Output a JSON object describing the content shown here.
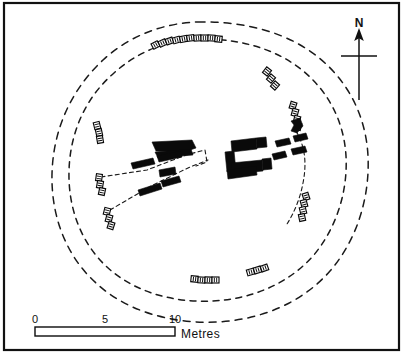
{
  "figure": {
    "kind": "archaeological-site-plan",
    "background_color": "#ffffff",
    "ink_color": "#0a0a0a",
    "frame": {
      "stroke": "#111111",
      "x": 4,
      "y": 3,
      "width": 395,
      "height": 347
    }
  },
  "north_arrow": {
    "label": "N",
    "label_x": 359,
    "label_y": 27,
    "stem_x": 359,
    "stem_top": 32,
    "stem_bottom": 100,
    "cross_y": 56,
    "cross_left": 341,
    "cross_right": 377,
    "head_points": "359,28 354.2,41 359,38.2 363.8,41"
  },
  "scale_bar": {
    "unit_label": "Metres",
    "unit_label_x": 181,
    "unit_label_y": 338,
    "tick_labels": [
      "0",
      "5",
      "10"
    ],
    "tick_values": [
      0,
      5,
      10
    ],
    "tick_x": [
      35,
      105,
      175
    ],
    "tick_label_y": 323,
    "bar_x": 35,
    "bar_y": 327,
    "bar_width": 140,
    "bar_height": 9,
    "segments_metres": 1,
    "filled_segments": [
      {
        "x": 35,
        "width": 14
      },
      {
        "x": 63,
        "width": 14
      },
      {
        "x": 91,
        "width": 14
      }
    ]
  },
  "cairn_rings": [
    {
      "name": "outer-cairn-edge",
      "path": "M 198 22 C 246 21 288 33 318 57 C 348 81 366 116 368 156 C 370 197 357 240 330 271 C 303 302 262 320 216 322 C 169 324 125 310 96 283 C 66 256 51 216 52 174 C 53 131 70 91 103 60 C 129 36 163 23 198 22 Z"
    },
    {
      "name": "inner-cairn-edge",
      "path": "M 197 39 C 239 38 276 49 302 70 C 328 91 344 121 346 156 C 348 192 336 229 313 256 C 289 283 253 299 213 301 C 171 303 133 291 107 267 C 81 243 68 208 69 171 C 70 133 85 98 114 73 C 137 52 167 40 197 39 Z"
    }
  ],
  "passage_outlines": [
    {
      "name": "passage-south-west",
      "path": "M 101 177 L 147 170 L 186 155 L 205 150"
    },
    {
      "name": "passage-west-lower",
      "path": "M 110 210 L 151 186 L 190 167 L 208 160"
    },
    {
      "name": "passage-chamber-west-link",
      "path": "M 205 150 L 207 162 L 196 166"
    },
    {
      "name": "passage-north-east-curve",
      "path": "M 296 131 C 305 146 307 163 303 183 C 300 199 294 213 287 224"
    }
  ],
  "orthostats": [
    {
      "name": "stone-w-large-top",
      "points": "152,142 192,140 196,148 184,152 156,151"
    },
    {
      "name": "stone-w-upper-bar",
      "points": "155,152 191,149 193,155 158,158"
    },
    {
      "name": "stone-w-mid-a",
      "points": "131,163 153,158 155,164 133,169"
    },
    {
      "name": "stone-w-mid-b",
      "points": "157,156 180,151 182,157 159,162"
    },
    {
      "name": "stone-w-small-centre",
      "points": "159,170 175,167 176,174 160,177"
    },
    {
      "name": "stone-w-lower-a",
      "points": "138,190 160,183 162,189 140,196"
    },
    {
      "name": "stone-w-lower-b",
      "points": "161,181 179,176 181,182 163,187"
    },
    {
      "name": "stone-c-top-bar",
      "points": "231,141 256,138 257,149 232,152"
    },
    {
      "name": "stone-c-top-bar-right",
      "points": "256,138 266,137 267,147 257,148"
    },
    {
      "name": "stone-c-left-upright",
      "points": "225,152 234,151 236,171 227,172"
    },
    {
      "name": "stone-c-bottom-bar",
      "points": "231,163 262,160 263,171 232,174"
    },
    {
      "name": "stone-c-bottom-right",
      "points": "262,159 271,158 272,169 263,170"
    },
    {
      "name": "stone-c-bottom-tail",
      "points": "227,170 256,166 257,175 228,179"
    },
    {
      "name": "stone-e-upper-a",
      "points": "275,141 289,138 291,144 277,147"
    },
    {
      "name": "stone-e-upper-b",
      "points": "293,136 306,133 308,139 295,142"
    },
    {
      "name": "stone-e-mid-a",
      "points": "272,154 285,151 287,157 274,160"
    },
    {
      "name": "stone-e-mid-b",
      "points": "291,149 305,146 307,152 293,155"
    },
    {
      "name": "stone-ne-hook",
      "points": "291,121 300,118 303,126 297,133 291,131 294,125"
    }
  ],
  "kerbstone_groups": [
    {
      "name": "kerb-north-arc",
      "rotation": -8,
      "stones": [
        {
          "x": 152,
          "y": 42,
          "w": 7,
          "h": 6,
          "rot": -28
        },
        {
          "x": 159,
          "y": 40,
          "w": 7,
          "h": 6,
          "rot": -24
        },
        {
          "x": 166,
          "y": 38,
          "w": 7,
          "h": 6,
          "rot": -20
        },
        {
          "x": 173,
          "y": 37,
          "w": 7,
          "h": 6,
          "rot": -16
        },
        {
          "x": 180,
          "y": 36,
          "w": 7,
          "h": 6,
          "rot": -12
        },
        {
          "x": 187,
          "y": 35,
          "w": 7,
          "h": 6,
          "rot": -8
        },
        {
          "x": 194,
          "y": 35,
          "w": 7,
          "h": 6,
          "rot": -4
        },
        {
          "x": 201,
          "y": 35,
          "w": 7,
          "h": 6,
          "rot": 0
        },
        {
          "x": 208,
          "y": 35,
          "w": 7,
          "h": 6,
          "rot": 3
        },
        {
          "x": 215,
          "y": 36,
          "w": 7,
          "h": 6,
          "rot": 6
        }
      ]
    },
    {
      "name": "kerb-north-east",
      "stones": [
        {
          "x": 264,
          "y": 68,
          "w": 6,
          "h": 7,
          "rot": 38
        },
        {
          "x": 268,
          "y": 75,
          "w": 6,
          "h": 7,
          "rot": 40
        },
        {
          "x": 272,
          "y": 82,
          "w": 6,
          "h": 7,
          "rot": 42
        }
      ]
    },
    {
      "name": "kerb-east-upper",
      "stones": [
        {
          "x": 290,
          "y": 102,
          "w": 6,
          "h": 7,
          "rot": 18
        },
        {
          "x": 292,
          "y": 109,
          "w": 6,
          "h": 7,
          "rot": 16
        },
        {
          "x": 294,
          "y": 116,
          "w": 6,
          "h": 7,
          "rot": 14
        },
        {
          "x": 295,
          "y": 123,
          "w": 6,
          "h": 7,
          "rot": 12
        }
      ]
    },
    {
      "name": "kerb-east-lower",
      "stones": [
        {
          "x": 303,
          "y": 193,
          "w": 6,
          "h": 7,
          "rot": -18
        },
        {
          "x": 301,
          "y": 200,
          "w": 6,
          "h": 7,
          "rot": -16
        },
        {
          "x": 300,
          "y": 207,
          "w": 6,
          "h": 7,
          "rot": -14
        },
        {
          "x": 299,
          "y": 214,
          "w": 6,
          "h": 7,
          "rot": -12
        }
      ]
    },
    {
      "name": "kerb-west-upper",
      "stones": [
        {
          "x": 94,
          "y": 122,
          "w": 6,
          "h": 7,
          "rot": -14
        },
        {
          "x": 96,
          "y": 129,
          "w": 6,
          "h": 7,
          "rot": -12
        },
        {
          "x": 97,
          "y": 136,
          "w": 6,
          "h": 7,
          "rot": -10
        }
      ]
    },
    {
      "name": "kerb-west-lower",
      "stones": [
        {
          "x": 96,
          "y": 174,
          "w": 6,
          "h": 7,
          "rot": 8
        },
        {
          "x": 97,
          "y": 181,
          "w": 6,
          "h": 7,
          "rot": 10
        },
        {
          "x": 99,
          "y": 188,
          "w": 6,
          "h": 7,
          "rot": 12
        }
      ]
    },
    {
      "name": "kerb-south-west",
      "stones": [
        {
          "x": 104,
          "y": 208,
          "w": 6,
          "h": 7,
          "rot": 14
        },
        {
          "x": 106,
          "y": 215,
          "w": 6,
          "h": 7,
          "rot": 16
        },
        {
          "x": 108,
          "y": 222,
          "w": 6,
          "h": 7,
          "rot": 18
        }
      ]
    },
    {
      "name": "kerb-south-centre",
      "stones": [
        {
          "x": 191,
          "y": 276,
          "w": 7,
          "h": 6,
          "rot": 6
        },
        {
          "x": 198,
          "y": 277,
          "w": 7,
          "h": 6,
          "rot": 4
        },
        {
          "x": 205,
          "y": 277,
          "w": 7,
          "h": 6,
          "rot": 2
        },
        {
          "x": 212,
          "y": 277,
          "w": 7,
          "h": 6,
          "rot": 0
        }
      ]
    },
    {
      "name": "kerb-south-east",
      "stones": [
        {
          "x": 247,
          "y": 269,
          "w": 7,
          "h": 6,
          "rot": -16
        },
        {
          "x": 254,
          "y": 267,
          "w": 7,
          "h": 6,
          "rot": -18
        },
        {
          "x": 261,
          "y": 265,
          "w": 7,
          "h": 6,
          "rot": -20
        }
      ]
    }
  ]
}
